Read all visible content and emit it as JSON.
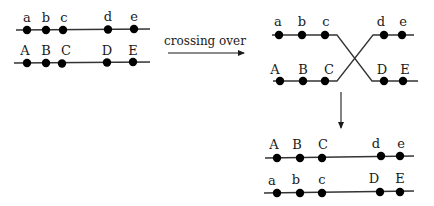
{
  "process_label": "crossing over",
  "colors": {
    "line": "#333333",
    "dot": "#000000",
    "text": "#1a1a1a",
    "background": "#ffffff"
  },
  "before": {
    "top": {
      "labels": [
        "a",
        "b",
        "c",
        "d",
        "e"
      ]
    },
    "bottom": {
      "labels": [
        "A",
        "B",
        "C",
        "D",
        "E"
      ]
    }
  },
  "during": {
    "top": {
      "labels": [
        "a",
        "b",
        "c",
        "d",
        "e"
      ]
    },
    "bottom": {
      "labels": [
        "A",
        "B",
        "C",
        "D",
        "E"
      ]
    }
  },
  "after": {
    "top": {
      "labels": [
        "A",
        "B",
        "C",
        "d",
        "e"
      ]
    },
    "bottom": {
      "labels": [
        "a",
        "b",
        "c",
        "D",
        "E"
      ]
    }
  }
}
